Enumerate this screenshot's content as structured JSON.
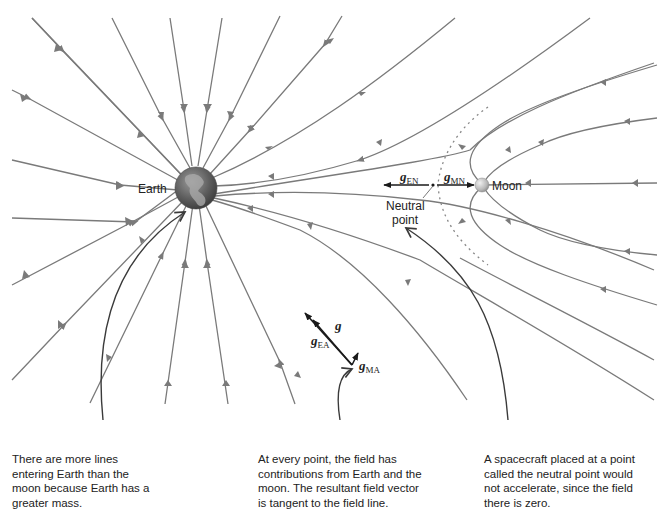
{
  "figure": {
    "colors": {
      "field_line": "#7a7a7a",
      "vector": "#1a1a1a",
      "text": "#222222",
      "background": "#ffffff"
    },
    "bodies": {
      "earth": {
        "label": "Earth",
        "icon": "earth-globe-icon"
      },
      "moon": {
        "label": "Moon",
        "icon": "moon-sphere-icon"
      }
    },
    "neutral_point": {
      "label_line1": "Neutral",
      "label_line2": "point"
    },
    "vectors": {
      "g_EN": {
        "symbol": "g",
        "subscript": "EN"
      },
      "g_MN": {
        "symbol": "g",
        "subscript": "MN"
      },
      "g": {
        "symbol": "g"
      },
      "g_EA": {
        "symbol": "g",
        "subscript": "EA"
      },
      "g_MA": {
        "symbol": "g",
        "subscript": "MA"
      }
    },
    "captions": [
      {
        "id": "more-lines",
        "text": "There are more lines entering Earth than the moon because Earth has a greater mass."
      },
      {
        "id": "tangent",
        "text": "At every point, the field has contributions from Earth and the moon. The resultant field vector is tangent to the field line."
      },
      {
        "id": "neutral",
        "text": "A spacecraft placed at a point called the neutral point would not accelerate, since the field there is zero."
      }
    ]
  }
}
